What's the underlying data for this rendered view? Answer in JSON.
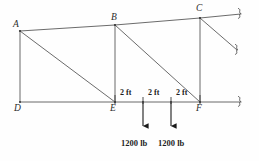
{
  "figure": {
    "kind": "statics-truss-diagram",
    "background_color": "#fefefe",
    "line_color": "#5a5a5a",
    "text_color": "#1f1f1f",
    "width": 259,
    "height": 161
  },
  "nodes": [
    {
      "id": "A",
      "label": "A",
      "x": 20,
      "y": 31,
      "label_x": 13,
      "label_y": 20
    },
    {
      "id": "B",
      "label": "B",
      "x": 115,
      "y": 25,
      "label_x": 111,
      "label_y": 13
    },
    {
      "id": "C",
      "label": "C",
      "x": 200,
      "y": 18,
      "label_x": 196,
      "label_y": 4
    },
    {
      "id": "D",
      "label": "D",
      "x": 20,
      "y": 102,
      "label_x": 14,
      "label_y": 104
    },
    {
      "id": "E",
      "label": "E",
      "x": 115,
      "y": 102,
      "label_x": 110,
      "label_y": 104
    },
    {
      "id": "F",
      "label": "F",
      "x": 200,
      "y": 102,
      "label_x": 196,
      "label_y": 104
    }
  ],
  "members": [
    {
      "name": "top-chord-ab",
      "x1": 20,
      "y1": 31,
      "x2": 115,
      "y2": 25
    },
    {
      "name": "top-chord-bc",
      "x1": 115,
      "y1": 25,
      "x2": 200,
      "y2": 18
    },
    {
      "name": "top-chord-extension",
      "x1": 200,
      "y1": 18,
      "x2": 241,
      "y2": 14
    },
    {
      "name": "bottom-chord-de",
      "x1": 20,
      "y1": 102,
      "x2": 115,
      "y2": 102
    },
    {
      "name": "bottom-chord-ef",
      "x1": 115,
      "y1": 102,
      "x2": 200,
      "y2": 102
    },
    {
      "name": "bottom-chord-extension",
      "x1": 200,
      "y1": 102,
      "x2": 241,
      "y2": 102
    },
    {
      "name": "vertical-ad",
      "x1": 20,
      "y1": 31,
      "x2": 20,
      "y2": 102
    },
    {
      "name": "vertical-be",
      "x1": 115,
      "y1": 25,
      "x2": 115,
      "y2": 102
    },
    {
      "name": "vertical-cf",
      "x1": 200,
      "y1": 18,
      "x2": 200,
      "y2": 102
    },
    {
      "name": "diagonal-ae",
      "x1": 20,
      "y1": 31,
      "x2": 115,
      "y2": 102
    },
    {
      "name": "diagonal-bf",
      "x1": 115,
      "y1": 25,
      "x2": 200,
      "y2": 102
    },
    {
      "name": "diagonal-c-extension",
      "x1": 200,
      "y1": 18,
      "x2": 237,
      "y2": 50
    }
  ],
  "break_marks": [
    {
      "name": "break-mark-top",
      "x": 240,
      "y": 14
    },
    {
      "name": "break-mark-middle",
      "x": 237,
      "y": 50
    },
    {
      "name": "break-mark-bottom",
      "x": 240,
      "y": 102
    }
  ],
  "dimensions": {
    "ticks_y_top": 96,
    "ticks_y_bottom": 104,
    "tick_x": [
      115,
      143,
      171,
      200
    ],
    "labels": [
      {
        "text": "2 ft",
        "x": 120,
        "y": 92
      },
      {
        "text": "2 ft",
        "x": 148,
        "y": 92
      },
      {
        "text": "2 ft",
        "x": 176,
        "y": 92
      }
    ]
  },
  "loads": [
    {
      "name": "load-arrow-1",
      "value": "1200 lb",
      "arrow_x": 143,
      "arrow_y_start": 101,
      "arrow_y_end": 131,
      "label_x": 121,
      "label_y": 139
    },
    {
      "name": "load-arrow-2",
      "value": "1200 lb",
      "arrow_x": 171,
      "arrow_y_start": 101,
      "arrow_y_end": 131,
      "label_x": 158,
      "label_y": 139
    }
  ]
}
